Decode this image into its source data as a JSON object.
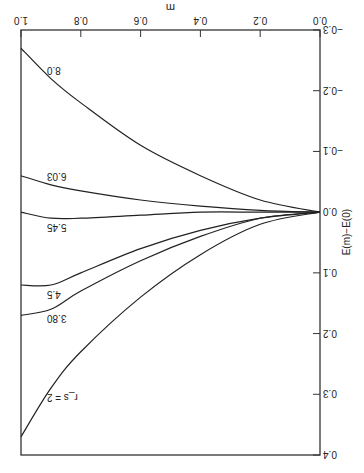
{
  "chart_data": {
    "type": "line",
    "title": "",
    "xlabel": "m",
    "ylabel": "E(m)−E(0)",
    "xlim": [
      0.0,
      1.0
    ],
    "ylim": [
      -0.3,
      0.4
    ],
    "x_ticks": [
      "0.0",
      "0.2",
      "0.4",
      "0.6",
      "0.8",
      "1.0"
    ],
    "y_ticks": [
      "−0.3",
      "−0.2",
      "−0.1",
      "0.0",
      "0.1",
      "0.2",
      "0.3",
      "0.4"
    ],
    "grid": false,
    "orientation_note": "figure rendered rotated 180 degrees",
    "series": [
      {
        "name": "r_s = 2",
        "label": "r_s = 2",
        "x": [
          0.0,
          0.2,
          0.4,
          0.6,
          0.8,
          0.9,
          1.0
        ],
        "y": [
          0.0,
          0.02,
          0.07,
          0.14,
          0.23,
          0.29,
          0.37
        ]
      },
      {
        "name": "3.80",
        "label": "3.80",
        "x": [
          0.0,
          0.2,
          0.4,
          0.6,
          0.8,
          0.9,
          1.0
        ],
        "y": [
          0.0,
          0.01,
          0.04,
          0.08,
          0.13,
          0.16,
          0.17
        ]
      },
      {
        "name": "4.5",
        "label": "4.5",
        "x": [
          0.0,
          0.2,
          0.4,
          0.6,
          0.8,
          0.9,
          1.0
        ],
        "y": [
          0.0,
          0.01,
          0.03,
          0.06,
          0.1,
          0.12,
          0.12
        ]
      },
      {
        "name": "5.45",
        "label": "5.45",
        "x": [
          0.0,
          0.2,
          0.4,
          0.6,
          0.8,
          0.9,
          1.0
        ],
        "y": [
          0.0,
          0.0,
          0.0,
          0.005,
          0.01,
          0.01,
          0.0
        ]
      },
      {
        "name": "6.03",
        "label": "6.03",
        "x": [
          0.0,
          0.2,
          0.4,
          0.6,
          0.8,
          0.9,
          1.0
        ],
        "y": [
          0.0,
          -0.003,
          -0.01,
          -0.02,
          -0.035,
          -0.045,
          -0.06
        ]
      },
      {
        "name": "8.0",
        "label": "8.0",
        "x": [
          0.0,
          0.2,
          0.4,
          0.6,
          0.8,
          0.9,
          1.0
        ],
        "y": [
          0.0,
          -0.02,
          -0.06,
          -0.11,
          -0.18,
          -0.22,
          -0.27
        ]
      }
    ]
  }
}
